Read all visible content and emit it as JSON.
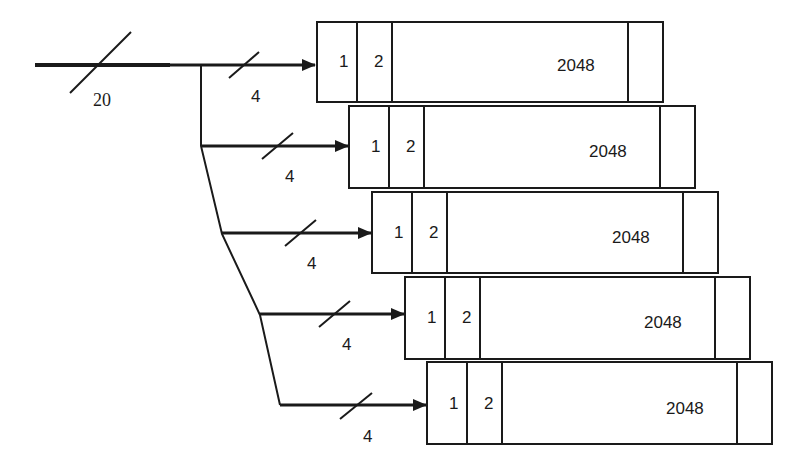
{
  "diagram": {
    "type": "bus-split-to-memory-blocks",
    "input_bus": {
      "label": "20",
      "width_bits": 20
    },
    "branches": [
      {
        "bus_label": "4",
        "block": {
          "cells": [
            "1",
            "2",
            "2048"
          ]
        }
      },
      {
        "bus_label": "4",
        "block": {
          "cells": [
            "1",
            "2",
            "2048"
          ]
        }
      },
      {
        "bus_label": "4",
        "block": {
          "cells": [
            "1",
            "2",
            "2048"
          ]
        }
      },
      {
        "bus_label": "4",
        "block": {
          "cells": [
            "1",
            "2",
            "2048"
          ]
        }
      },
      {
        "bus_label": "4",
        "block": {
          "cells": [
            "1",
            "2",
            "2048"
          ]
        }
      }
    ],
    "colors": {
      "line": "#1a1a1a",
      "background": "#ffffff"
    }
  }
}
